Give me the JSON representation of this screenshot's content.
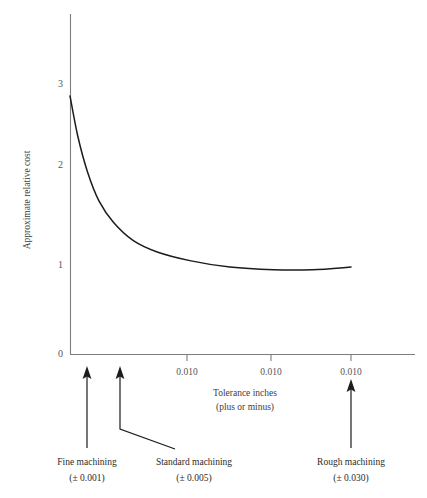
{
  "chart_data": {
    "type": "line",
    "title": "",
    "xlabel": "Tolerance inches",
    "xlabel_line2": "(plus or minus)",
    "ylabel": "Approximate relative cost",
    "xticklabels": [
      "0.010",
      "0.010",
      "0.010"
    ],
    "yticklabels": [
      "0",
      "1",
      "2",
      "3"
    ],
    "ylim": [
      0,
      3.6
    ],
    "grid": false,
    "legend": null,
    "series": [
      {
        "name": "Approximate relative cost vs tolerance",
        "points": [
          {
            "x": 0.001,
            "y": 2.9
          },
          {
            "x": 0.0018,
            "y": 2.45
          },
          {
            "x": 0.0028,
            "y": 2.05
          },
          {
            "x": 0.004,
            "y": 1.72
          },
          {
            "x": 0.0055,
            "y": 1.48
          },
          {
            "x": 0.0075,
            "y": 1.28
          },
          {
            "x": 0.01,
            "y": 1.15
          },
          {
            "x": 0.0135,
            "y": 1.05
          },
          {
            "x": 0.0175,
            "y": 0.98
          },
          {
            "x": 0.022,
            "y": 0.95
          },
          {
            "x": 0.026,
            "y": 0.95
          },
          {
            "x": 0.03,
            "y": 0.98
          }
        ]
      }
    ],
    "annotations": [
      {
        "id": "fine",
        "label": "Fine machining",
        "value": "(± 0.001)"
      },
      {
        "id": "standard",
        "label": "Standard machining",
        "value": "(± 0.005)"
      },
      {
        "id": "rough",
        "label": "Rough machining",
        "value": "(± 0.030)"
      }
    ]
  },
  "axes": {
    "y_title": "Approximate relative cost",
    "x_title_line1": "Tolerance inches",
    "x_title_line2": "(plus or minus)",
    "y_ticks": [
      {
        "label": "3"
      },
      {
        "label": "2"
      },
      {
        "label": "1"
      },
      {
        "label": "0"
      }
    ],
    "x_ticks": [
      {
        "label": "0.010"
      },
      {
        "label": "0.010"
      },
      {
        "label": "0.010"
      }
    ]
  },
  "callouts": [
    {
      "label": "Fine machining",
      "tolerance": "(± 0.001)"
    },
    {
      "label": "Standard machining",
      "tolerance": "(± 0.005)"
    },
    {
      "label": "Rough machining",
      "tolerance": "(± 0.030)"
    }
  ],
  "colors": {
    "curve": "#1c1c1c",
    "axis": "#7d7d7d",
    "text": "#3d3d3d",
    "background": "#ffffff"
  }
}
